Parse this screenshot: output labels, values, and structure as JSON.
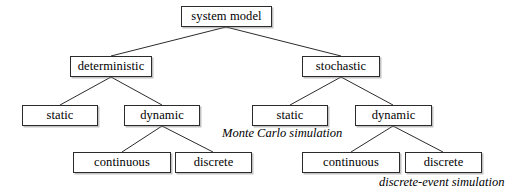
{
  "diagram": {
    "canvas": {
      "width": 526,
      "height": 194
    },
    "stroke_color": "#2b2b2b",
    "text_color": "#000000",
    "background_color": "#ffffff",
    "nodes": [
      {
        "id": "system-model",
        "label": "system model",
        "x": 181,
        "y": 6,
        "w": 91,
        "h": 21
      },
      {
        "id": "deterministic",
        "label": "deterministic",
        "x": 70,
        "y": 56,
        "w": 82,
        "h": 21
      },
      {
        "id": "stochastic",
        "label": "stochastic",
        "x": 302,
        "y": 56,
        "w": 78,
        "h": 21
      },
      {
        "id": "det-static",
        "label": "static",
        "x": 22,
        "y": 105,
        "w": 76,
        "h": 21
      },
      {
        "id": "det-dynamic",
        "label": "dynamic",
        "x": 124,
        "y": 105,
        "w": 76,
        "h": 21
      },
      {
        "id": "sto-static",
        "label": "static",
        "x": 252,
        "y": 105,
        "w": 76,
        "h": 21
      },
      {
        "id": "sto-dynamic",
        "label": "dynamic",
        "x": 355,
        "y": 105,
        "w": 77,
        "h": 21
      },
      {
        "id": "det-dyn-continuous",
        "label": "continuous",
        "x": 73,
        "y": 152,
        "w": 98,
        "h": 21
      },
      {
        "id": "det-dyn-discrete",
        "label": "discrete",
        "x": 175,
        "y": 152,
        "w": 77,
        "h": 21
      },
      {
        "id": "sto-dyn-continuous",
        "label": "continuous",
        "x": 302,
        "y": 152,
        "w": 98,
        "h": 21
      },
      {
        "id": "sto-dyn-discrete",
        "label": "discrete",
        "x": 405,
        "y": 152,
        "w": 77,
        "h": 21
      }
    ],
    "edges": [
      {
        "id": "edge-root-deterministic",
        "from": "system-model",
        "to": "deterministic",
        "x1": 226,
        "y1": 27,
        "x2": 111,
        "y2": 56
      },
      {
        "id": "edge-root-stochastic",
        "from": "system-model",
        "to": "stochastic",
        "x1": 226,
        "y1": 27,
        "x2": 341,
        "y2": 56
      },
      {
        "id": "edge-det-static",
        "from": "deterministic",
        "to": "det-static",
        "x1": 111,
        "y1": 77,
        "x2": 60,
        "y2": 105
      },
      {
        "id": "edge-det-dynamic",
        "from": "deterministic",
        "to": "det-dynamic",
        "x1": 111,
        "y1": 77,
        "x2": 162,
        "y2": 105
      },
      {
        "id": "edge-sto-static",
        "from": "stochastic",
        "to": "sto-static",
        "x1": 341,
        "y1": 77,
        "x2": 290,
        "y2": 105
      },
      {
        "id": "edge-sto-dynamic",
        "from": "stochastic",
        "to": "sto-dynamic",
        "x1": 341,
        "y1": 77,
        "x2": 393,
        "y2": 105
      },
      {
        "id": "edge-detdyn-continuous",
        "from": "det-dynamic",
        "to": "det-dyn-continuous",
        "x1": 162,
        "y1": 126,
        "x2": 122,
        "y2": 152
      },
      {
        "id": "edge-detdyn-discrete",
        "from": "det-dynamic",
        "to": "det-dyn-discrete",
        "x1": 162,
        "y1": 126,
        "x2": 213,
        "y2": 152
      },
      {
        "id": "edge-stodyn-continuous",
        "from": "sto-dynamic",
        "to": "sto-dyn-continuous",
        "x1": 393,
        "y1": 126,
        "x2": 351,
        "y2": 152
      },
      {
        "id": "edge-stodyn-discrete",
        "from": "sto-dynamic",
        "to": "sto-dyn-discrete",
        "x1": 393,
        "y1": 126,
        "x2": 443,
        "y2": 152
      }
    ],
    "annotations": [
      {
        "id": "monte-carlo-simulation",
        "text": "Monte Carlo simulation",
        "x": 222,
        "y": 127
      },
      {
        "id": "discrete-event-simulation",
        "text": "discrete-event simulation",
        "x": 379,
        "y": 176
      }
    ]
  }
}
